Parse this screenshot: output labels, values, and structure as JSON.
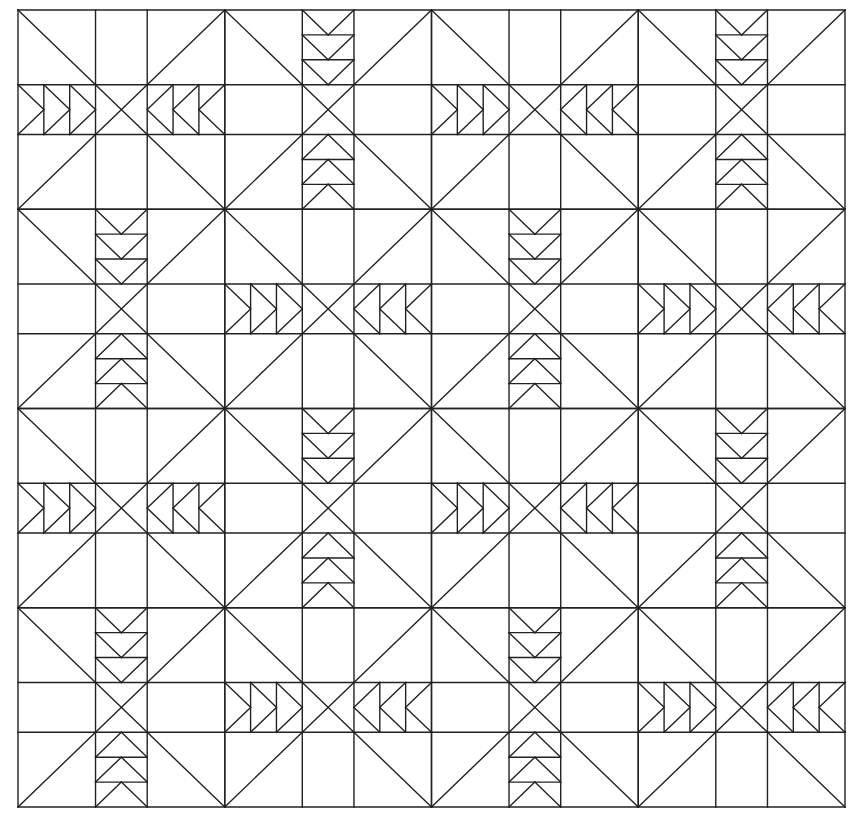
{
  "diagram": {
    "type": "quilt-pattern",
    "line_color": "#222222",
    "background": "#ffffff",
    "origin": [
      18,
      10
    ],
    "block_width": 206.75,
    "block_height": 199.25,
    "rows": 4,
    "cols": 4,
    "subdivisions": [
      0,
      0.375,
      0.625,
      1
    ],
    "geese_per_segment": 3,
    "layout": [
      [
        "A",
        "B",
        "A",
        "B"
      ],
      [
        "B",
        "A",
        "B",
        "A"
      ],
      [
        "A",
        "B",
        "A",
        "B"
      ],
      [
        "B",
        "A",
        "B",
        "A"
      ]
    ],
    "block_types": {
      "A": "horizontal flying geese in middle row pointing toward center",
      "B": "vertical flying geese in middle column pointing toward center"
    }
  }
}
